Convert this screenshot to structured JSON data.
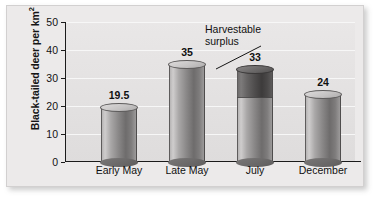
{
  "chart_data": {
    "type": "bar",
    "title": "",
    "subtitle": "",
    "xlabel": "",
    "ylabel": "Black-tailed deer per km2",
    "ylabel_main": "Black-tailed deer per km",
    "ylabel_sup": "2",
    "categories": [
      "Early May",
      "Late May",
      "July",
      "December"
    ],
    "values": [
      19.5,
      35,
      33,
      24
    ],
    "value_labels": [
      "19.5",
      "35",
      "33",
      "24"
    ],
    "series": [
      {
        "name": "Population density",
        "values": [
          19.5,
          35,
          33,
          24
        ]
      },
      {
        "name": "Harvestable surplus",
        "values": [
          0,
          0,
          10,
          0
        ],
        "segment_base": [
          0,
          0,
          23,
          0
        ],
        "segment_top": [
          0,
          0,
          33,
          0
        ]
      }
    ],
    "ylim": [
      0,
      50
    ],
    "yticks": [
      0,
      10,
      20,
      30,
      40,
      50
    ],
    "ytick_labels": [
      "0",
      "10",
      "20",
      "30",
      "40",
      "50"
    ],
    "grid": true,
    "grid_axis": "y",
    "legend": "none",
    "legend_position": "none",
    "annotations": [
      {
        "text_line1": "Harvestable",
        "text_line2": "surplus",
        "points_to_category": "July",
        "points_to_value": 30
      }
    ],
    "colors": {
      "bar_light": "#8a8888",
      "bar_dark": "#4c4a4a",
      "plot_background": "#e6e4e4",
      "card_background": "#eceaea",
      "gridline": "#f7f7f7",
      "axis": "#1b1b1b",
      "text": "#101010"
    }
  }
}
